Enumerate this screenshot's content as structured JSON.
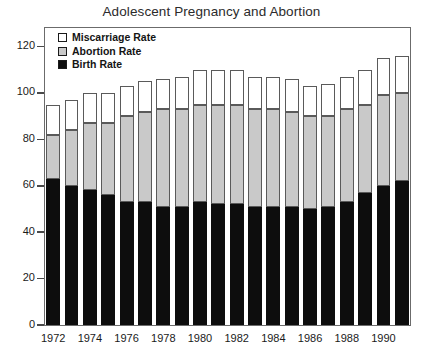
{
  "chart_data": {
    "type": "bar",
    "stacked": true,
    "title": "Adolescent Pregnancy and Abortion",
    "xlabel": "",
    "ylabel": "",
    "ylim": [
      0,
      128
    ],
    "yticks": [
      0,
      20,
      40,
      60,
      80,
      100,
      120
    ],
    "ytick_labels": [
      "0",
      "20",
      "40",
      "60",
      "80",
      "100",
      "120"
    ],
    "grid": false,
    "legend_position": "top-left-inside",
    "categories": [
      "1972",
      "1973",
      "1974",
      "1975",
      "1976",
      "1977",
      "1978",
      "1979",
      "1980",
      "1981",
      "1982",
      "1983",
      "1984",
      "1985",
      "1986",
      "1987",
      "1988",
      "1989",
      "1990",
      "1991"
    ],
    "xtick_labels": [
      "1972",
      "1974",
      "1976",
      "1978",
      "1980",
      "1982",
      "1984",
      "1986",
      "1988",
      "1990"
    ],
    "xtick_categories": [
      "1972",
      "1974",
      "1976",
      "1978",
      "1980",
      "1982",
      "1984",
      "1986",
      "1988",
      "1990"
    ],
    "series": [
      {
        "name": "Birth Rate",
        "color": "#0d0d0d",
        "values": [
          63,
          60,
          58,
          56,
          53,
          53,
          51,
          51,
          53,
          52,
          52,
          51,
          51,
          51,
          50,
          51,
          53,
          57,
          60,
          62
        ]
      },
      {
        "name": "Abortion Rate",
        "color": "#c9c9c9",
        "values": [
          19,
          24,
          29,
          31,
          37,
          39,
          42,
          42,
          42,
          43,
          43,
          42,
          42,
          41,
          40,
          39,
          40,
          38,
          39,
          38
        ]
      },
      {
        "name": "Miscarriage Rate",
        "color": "#ffffff",
        "values": [
          13,
          13,
          13,
          13,
          13,
          13,
          13,
          14,
          15,
          15,
          15,
          14,
          14,
          14,
          13,
          14,
          14,
          15,
          16,
          16
        ]
      }
    ],
    "stack_order_bottom_to_top": [
      "Birth Rate",
      "Abortion Rate",
      "Miscarriage Rate"
    ],
    "totals": [
      95,
      97,
      100,
      100,
      103,
      105,
      106,
      107,
      110,
      110,
      110,
      107,
      107,
      106,
      103,
      104,
      107,
      110,
      115,
      116
    ]
  },
  "legend": {
    "items": [
      {
        "label": "Miscarriage Rate",
        "swatch_color": "#ffffff"
      },
      {
        "label": "Abortion Rate",
        "swatch_color": "#c9c9c9"
      },
      {
        "label": "Birth Rate",
        "swatch_color": "#0d0d0d"
      }
    ]
  },
  "colors": {
    "birth": "#0d0d0d",
    "abortion": "#c9c9c9",
    "miscarriage": "#ffffff",
    "frame": "#6b6b6b",
    "text": "#1a1a1a"
  }
}
